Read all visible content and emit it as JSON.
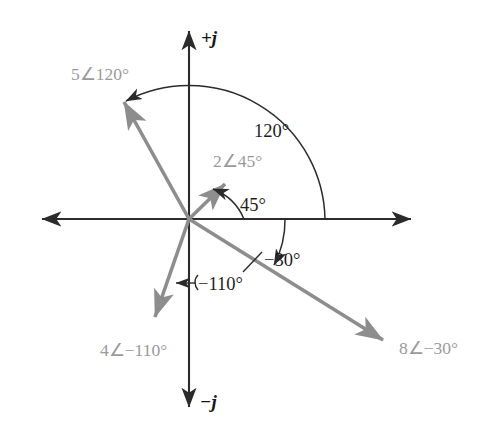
{
  "figure": {
    "background_color": "#ffffff",
    "origin": {
      "x": 189,
      "y": 219
    },
    "colors": {
      "axis": "#2b2b2b",
      "vector": "#8d8d8d",
      "vector_label": "#9a9a9a",
      "angle_label": "#1d1d1d",
      "arc": "#2b2b2b"
    },
    "axes": {
      "imaginary_positive_label": "+j",
      "imaginary_negative_label": "−j",
      "real_axis_label": "",
      "vertical_top": {
        "x": 189,
        "y": 24
      },
      "vertical_bottom": {
        "x": 189,
        "y": 414
      },
      "horizontal_left": {
        "x": 35,
        "y": 219
      },
      "horizontal_right": {
        "x": 418,
        "y": 219
      }
    },
    "vectors": [
      {
        "name": "phasor-5-at-120",
        "label": "5∠120°",
        "magnitude": 5,
        "angle_deg": 120,
        "tip": {
          "x": 118,
          "y": 95
        },
        "label_pos": {
          "x": 71,
          "y": 80
        }
      },
      {
        "name": "phasor-2-at-45",
        "label": "2∠45°",
        "magnitude": 2,
        "angle_deg": 45,
        "tip": {
          "x": 232,
          "y": 178
        },
        "label_pos": {
          "x": 214,
          "y": 166
        }
      },
      {
        "name": "phasor-8-at-minus-30",
        "label": "8∠−30°",
        "magnitude": 8,
        "angle_deg": -30,
        "tip": {
          "x": 392,
          "y": 347
        },
        "label_pos": {
          "x": 399,
          "y": 354
        }
      },
      {
        "name": "phasor-4-at-minus-110",
        "label": "4∠−110°",
        "magnitude": 4,
        "angle_deg": -110,
        "tip": {
          "x": 150,
          "y": 325
        },
        "label_pos": {
          "x": 101,
          "y": 355
        }
      }
    ],
    "angle_arcs": [
      {
        "name": "arc-120",
        "label": "120°",
        "value_deg": 120,
        "radius": 136,
        "label_pos": {
          "x": 254,
          "y": 130
        },
        "arrow_at": "counterclockwise-end"
      },
      {
        "name": "arc-45",
        "label": "45°",
        "value_deg": 45,
        "radius": 55,
        "label_pos": {
          "x": 239,
          "y": 205
        },
        "arrow_at": "counterclockwise-end"
      },
      {
        "name": "arc-minus-30",
        "label": "−30°",
        "value_deg": -30,
        "radius": 96,
        "label_pos": {
          "x": 267,
          "y": 259
        },
        "arrow_at": "clockwise-end"
      },
      {
        "name": "leader-minus-110",
        "label": "−110°",
        "value_deg": -110,
        "label_pos": {
          "x": 196,
          "y": 284
        },
        "arrow_at": "left"
      }
    ]
  }
}
